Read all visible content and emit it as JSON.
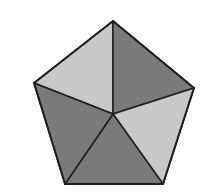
{
  "figure": {
    "shape": "pentagon-divided-into-five-triangles",
    "center": [
      113,
      114
    ],
    "vertices": {
      "top": [
        113,
        21
      ],
      "right": [
        194,
        88
      ],
      "bottom_right": [
        163,
        184
      ],
      "bottom_left": [
        65,
        184
      ],
      "left": [
        34,
        83
      ]
    },
    "triangles": [
      {
        "name": "top-left",
        "shade": "light",
        "fill": "#c8c8c8"
      },
      {
        "name": "top-right",
        "shade": "dark",
        "fill": "#7a7a7a"
      },
      {
        "name": "right",
        "shade": "light",
        "fill": "#c8c8c8"
      },
      {
        "name": "bottom",
        "shade": "dark",
        "fill": "#7a7a7a"
      },
      {
        "name": "left",
        "shade": "dark",
        "fill": "#7a7a7a"
      }
    ],
    "stroke": "#1e1e1e",
    "background": "#ffffff"
  }
}
